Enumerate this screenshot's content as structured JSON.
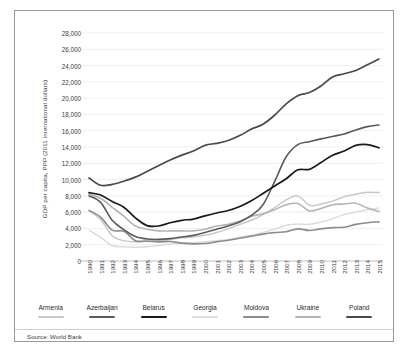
{
  "figure": {
    "source_note": "Source: World Bank"
  },
  "chart_data": {
    "type": "line",
    "title": "",
    "xlabel": "",
    "ylabel": "GDP per capita, PPP (2011 international dollars)",
    "grid": true,
    "legend_position": "bottom",
    "ylim": [
      0,
      28000
    ],
    "ytick_step": 2000,
    "ytick_labels": [
      "28,000",
      "26,000",
      "24,000",
      "22,000",
      "20,000",
      "18,000",
      "16,000",
      "14,000",
      "12,000",
      "10,000",
      "8,000",
      "6,000",
      "4,000",
      "2,000",
      "0"
    ],
    "ytick_values": [
      28000,
      26000,
      24000,
      22000,
      20000,
      18000,
      16000,
      14000,
      12000,
      10000,
      8000,
      6000,
      4000,
      2000,
      0
    ],
    "x": [
      1990,
      1991,
      1992,
      1993,
      1994,
      1995,
      1996,
      1997,
      1998,
      1999,
      2000,
      2001,
      2002,
      2003,
      2004,
      2005,
      2006,
      2007,
      2008,
      2009,
      2010,
      2011,
      2012,
      2013,
      2014,
      2015
    ],
    "categories": [
      "1990",
      "1991",
      "1992",
      "1993",
      "1994",
      "1995",
      "1996",
      "1997",
      "1998",
      "1999",
      "2000",
      "2001",
      "2002",
      "2003",
      "2004",
      "2005",
      "2006",
      "2007",
      "2008",
      "2009",
      "2010",
      "2011",
      "2012",
      "2013",
      "2014",
      "2015"
    ],
    "series": [
      {
        "name": "Armenia",
        "color": "#c8c8c8",
        "width": 1.5,
        "values": [
          6200,
          5100,
          3100,
          2500,
          2350,
          2400,
          2500,
          2650,
          2850,
          2950,
          3150,
          3500,
          3950,
          4500,
          5000,
          5700,
          6550,
          7500,
          8000,
          6850,
          7000,
          7350,
          7900,
          8200,
          8450,
          8400
        ]
      },
      {
        "name": "Azerbaijan",
        "color": "#5a5a5a",
        "width": 1.6,
        "values": [
          8000,
          7200,
          5000,
          3850,
          3000,
          2700,
          2650,
          2750,
          2950,
          3150,
          3500,
          3900,
          4300,
          4800,
          5600,
          6900,
          9750,
          12800,
          14300,
          14650,
          15000,
          15300,
          15600,
          16100,
          16500,
          16700
        ]
      },
      {
        "name": "Belarus",
        "color": "#1a1a1a",
        "width": 1.7,
        "values": [
          8400,
          8100,
          7300,
          6600,
          5300,
          4350,
          4300,
          4700,
          5000,
          5150,
          5550,
          5900,
          6200,
          6700,
          7400,
          8300,
          9200,
          10100,
          11200,
          11250,
          12100,
          13000,
          13500,
          14200,
          14300,
          13900
        ]
      },
      {
        "name": "Georgia",
        "color": "#dcdcdc",
        "width": 1.5,
        "values": [
          3800,
          2900,
          1900,
          1750,
          1700,
          1750,
          1900,
          2100,
          2200,
          2250,
          2350,
          2500,
          2650,
          2950,
          3150,
          3500,
          3900,
          4400,
          4550,
          4500,
          4800,
          5200,
          5700,
          6000,
          6300,
          6500
        ]
      },
      {
        "name": "Moldova",
        "color": "#8c8c8c",
        "width": 1.6,
        "values": [
          6200,
          5400,
          3800,
          3650,
          2500,
          2450,
          2350,
          2400,
          2200,
          2100,
          2150,
          2350,
          2550,
          2800,
          3050,
          3300,
          3500,
          3600,
          3950,
          3750,
          3950,
          4100,
          4150,
          4500,
          4700,
          4800
        ]
      },
      {
        "name": "Ukraine",
        "color": "#b4b4b4",
        "width": 1.6,
        "values": [
          8200,
          7700,
          6600,
          5500,
          4300,
          3900,
          3700,
          3700,
          3700,
          3700,
          3900,
          4300,
          4500,
          4900,
          5500,
          5800,
          6300,
          6900,
          7050,
          6150,
          6450,
          6900,
          7000,
          7100,
          6500,
          6100
        ]
      },
      {
        "name": "Poland",
        "color": "#4a4a4a",
        "width": 1.7,
        "values": [
          10200,
          9300,
          9400,
          9800,
          10300,
          11000,
          11700,
          12400,
          13000,
          13500,
          14200,
          14450,
          14800,
          15400,
          16200,
          16800,
          17900,
          19300,
          20300,
          20700,
          21500,
          22600,
          23000,
          23400,
          24100,
          24800
        ]
      }
    ]
  },
  "legend": {
    "items": [
      {
        "label": "Armenia",
        "color": "#c8c8c8"
      },
      {
        "label": "Azerbaijan",
        "color": "#5a5a5a"
      },
      {
        "label": "Belarus",
        "color": "#1a1a1a"
      },
      {
        "label": "Georgia",
        "color": "#dcdcdc"
      },
      {
        "label": "Moldova",
        "color": "#8c8c8c"
      },
      {
        "label": "Ukraine",
        "color": "#b4b4b4"
      },
      {
        "label": "Poland",
        "color": "#4a4a4a"
      }
    ]
  }
}
